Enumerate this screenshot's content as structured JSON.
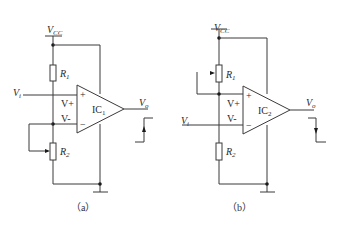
{
  "diagram": {
    "type": "circuit-schematic",
    "circuits": [
      {
        "id": "a",
        "caption": "（a）",
        "supply": {
          "label": "V",
          "sub": "CC"
        },
        "input": {
          "label": "V",
          "sub": "i"
        },
        "output": {
          "label": "V",
          "sub": "o"
        },
        "opamp": {
          "label": "IC",
          "sub": "1",
          "plus": "+",
          "minus": "−"
        },
        "resistors": [
          {
            "label": "R",
            "sub": "1",
            "type": "fixed"
          },
          {
            "label": "R",
            "sub": "2",
            "type": "potentiometer"
          }
        ],
        "node_labels": {
          "vplus": "V+",
          "vminus": "V-"
        },
        "waveform": "rising-step"
      },
      {
        "id": "b",
        "caption": "（b）",
        "supply": {
          "label": "V",
          "sub": "CC"
        },
        "input": {
          "label": "V",
          "sub": "i"
        },
        "output": {
          "label": "V",
          "sub": "o"
        },
        "opamp": {
          "label": "IC",
          "sub": "2",
          "plus": "+",
          "minus": "−"
        },
        "resistors": [
          {
            "label": "R",
            "sub": "1",
            "type": "potentiometer"
          },
          {
            "label": "R",
            "sub": "2",
            "type": "fixed"
          }
        ],
        "node_labels": {
          "vplus": "V+",
          "vminus": "V-"
        },
        "waveform": "falling-step"
      }
    ]
  }
}
